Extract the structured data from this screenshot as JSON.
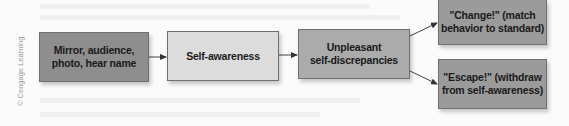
{
  "diagram": {
    "type": "flowchart",
    "direction": "left-to-right",
    "nodes": [
      {
        "id": "trigger",
        "label": "Mirror, audience,\nphoto, hear name",
        "fill": "#8e8e8e"
      },
      {
        "id": "awareness",
        "label": "Self-awareness",
        "fill": "#dcdcdc"
      },
      {
        "id": "discrepancies",
        "label": "Unpleasant\nself-discrepancies",
        "fill": "#ababab"
      },
      {
        "id": "change",
        "label": "\"Change!\" (match\nbehavior to standard)",
        "fill": "#9b9b9b"
      },
      {
        "id": "escape",
        "label": "\"Escape!\" (withdraw\nfrom self-awareness)",
        "fill": "#9b9b9b"
      }
    ],
    "edges": [
      {
        "from": "trigger",
        "to": "awareness"
      },
      {
        "from": "awareness",
        "to": "discrepancies"
      },
      {
        "from": "discrepancies",
        "to": "change"
      },
      {
        "from": "discrepancies",
        "to": "escape"
      }
    ]
  },
  "credit": "© Cengage Learning"
}
